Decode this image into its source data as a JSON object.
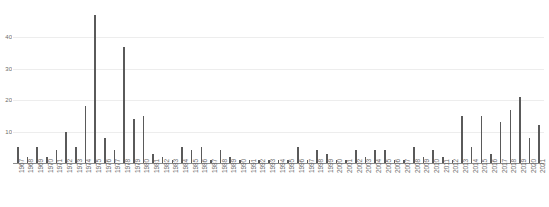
{
  "chart_data": {
    "type": "bar",
    "title": "",
    "subtitle": "",
    "xlabel": "",
    "ylabel": "",
    "ylim": [
      0,
      50
    ],
    "grid": true,
    "legend": "none",
    "yticks": [
      10,
      20,
      30,
      40
    ],
    "ytick_labels": [
      "10",
      "20",
      "30",
      "40"
    ],
    "bar_color": "#5a5a5a",
    "gridline_color": "#ededed",
    "axis_color": "#8c8c8c",
    "tick_text_color": "#6b6b6b",
    "categories": [
      "1967",
      "1968",
      "1969",
      "1970",
      "1971",
      "1972",
      "1973",
      "1974",
      "1975",
      "1976",
      "1977",
      "1978",
      "1979",
      "1980",
      "1981",
      "1982",
      "1983",
      "1984",
      "1985",
      "1986",
      "1987",
      "1988",
      "1989",
      "1990",
      "1991",
      "1992",
      "1993",
      "1994",
      "1995",
      "1996",
      "1997",
      "1998",
      "1999",
      "2000",
      "2001",
      "2002",
      "2003",
      "2004",
      "2005",
      "2006",
      "2007",
      "2008",
      "2009",
      "2010",
      "2011",
      "2012",
      "2013",
      "2014",
      "2015",
      "2016",
      "2017",
      "2018",
      "2019",
      "2020",
      "2021"
    ],
    "values": [
      5,
      2,
      5,
      2,
      4,
      10,
      5,
      18,
      47,
      8,
      4,
      37,
      14,
      15,
      3,
      2,
      1,
      5,
      4,
      5,
      1,
      4,
      2,
      1,
      1,
      1,
      1,
      1,
      1,
      5,
      1,
      4,
      3,
      1,
      1,
      4,
      2,
      4,
      4,
      1,
      1,
      5,
      2,
      4,
      2,
      1,
      15,
      5,
      15,
      3,
      13,
      17,
      21,
      8,
      12
    ]
  }
}
